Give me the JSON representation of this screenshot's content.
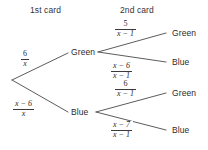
{
  "diagram": {
    "background_color": "#ffffff",
    "line_color": "#4a4a4a",
    "text_color": "#2b2b2b"
  },
  "headers": {
    "first": "1st card",
    "second": "2nd card"
  },
  "nodes": {
    "first_level": [
      {
        "label": "Green"
      },
      {
        "label": "Blue"
      }
    ],
    "leaves": [
      {
        "label": "Green"
      },
      {
        "label": "Blue"
      },
      {
        "label": "Green"
      },
      {
        "label": "Blue"
      }
    ]
  },
  "probabilities": {
    "first_level": [
      {
        "numerator": "6",
        "denominator": "x",
        "text": "6/x"
      },
      {
        "numerator": "x − 6",
        "denominator": "x",
        "text": "(x-6)/x"
      }
    ],
    "second_level": [
      {
        "numerator": "5",
        "denominator": "x − 1",
        "text": "5/(x-1)"
      },
      {
        "numerator": "x − 6",
        "denominator": "x − 1",
        "text": "(x-6)/(x-1)"
      },
      {
        "numerator": "6",
        "denominator": "x − 1",
        "text": "6/(x-1)"
      },
      {
        "numerator": "x − 7",
        "denominator": "x − 1",
        "text": "(x-7)/(x-1)"
      }
    ]
  }
}
